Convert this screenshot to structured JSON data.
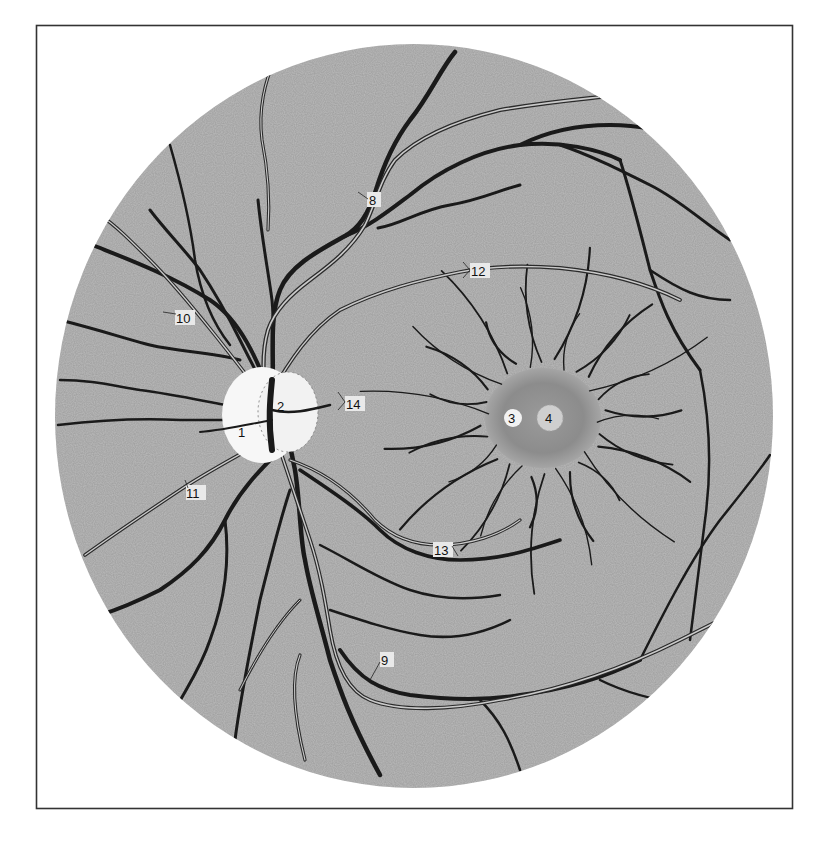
{
  "figure": {
    "colors": {
      "background": "#ffffff",
      "frame": "#333333",
      "fundus": "#bdbdbd",
      "optic_disc": "#f7f7f7",
      "macula": "#8f8f8f",
      "macula_ring": "#a3a3a3",
      "fovea": "#cfcfcf",
      "vein": "#1a1a1a",
      "artery_wall": "#2a2a2a",
      "artery_lumen": "#c9c9c9"
    },
    "labels": [
      {
        "id": "1",
        "text": "1",
        "target": "optic disc"
      },
      {
        "id": "2",
        "text": "2",
        "target": "physiological cup"
      },
      {
        "id": "3",
        "text": "3",
        "target": "macula"
      },
      {
        "id": "4",
        "text": "4",
        "target": "fovea centralis"
      },
      {
        "id": "8",
        "text": "8",
        "target": "superior temporal artery"
      },
      {
        "id": "9",
        "text": "9",
        "target": "inferior temporal artery"
      },
      {
        "id": "10",
        "text": "10",
        "target": "superior nasal artery"
      },
      {
        "id": "11",
        "text": "11",
        "target": "inferior nasal artery"
      },
      {
        "id": "12",
        "text": "12",
        "target": "superior macular artery"
      },
      {
        "id": "13",
        "text": "13",
        "target": "inferior macular artery"
      },
      {
        "id": "14",
        "text": "14",
        "target": "medial macular artery"
      }
    ]
  }
}
